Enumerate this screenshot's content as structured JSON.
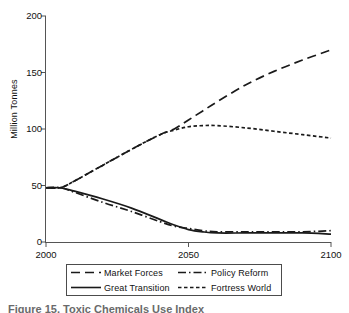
{
  "figure": {
    "caption": "Figure 15.  Toxic Chemicals Use Index",
    "ylabel": "Million Tonnes"
  },
  "chart_data": {
    "type": "line",
    "title": "",
    "xlabel": "",
    "ylabel": "Million Tonnes",
    "xlim": [
      2000,
      2100
    ],
    "ylim": [
      0,
      200
    ],
    "xticks": [
      2000,
      2050,
      2100
    ],
    "yticks": [
      0,
      50,
      100,
      150,
      200
    ],
    "grid": false,
    "legend_position": "below-plot",
    "x": [
      2000,
      2005,
      2010,
      2020,
      2030,
      2040,
      2045,
      2050,
      2055,
      2060,
      2070,
      2080,
      2090,
      2100
    ],
    "series": [
      {
        "name": "Market Forces",
        "style": "dashed",
        "color": "#1a1a1a",
        "values": [
          48,
          48,
          54,
          68,
          82,
          95,
          100,
          108,
          116,
          124,
          139,
          151,
          161,
          170
        ]
      },
      {
        "name": "Policy Reform",
        "style": "dash-dot",
        "color": "#1a1a1a",
        "values": [
          48,
          48,
          44,
          35,
          27,
          18,
          14,
          12,
          10,
          9,
          9,
          9,
          9,
          10
        ]
      },
      {
        "name": "Great Transition",
        "style": "solid",
        "color": "#1a1a1a",
        "values": [
          48,
          48,
          45,
          38,
          30,
          20,
          15,
          11,
          9,
          8,
          8,
          8,
          8,
          7
        ]
      },
      {
        "name": "Fortress World",
        "style": "short-dashed",
        "color": "#1a1a1a",
        "values": [
          48,
          48,
          54,
          68,
          82,
          95,
          99,
          102,
          103,
          103,
          101,
          98,
          95,
          92
        ]
      }
    ]
  },
  "legend": {
    "entries": [
      {
        "label": "Market Forces",
        "style": "dashed"
      },
      {
        "label": "Policy Reform",
        "style": "dash-dot"
      },
      {
        "label": "Great Transition",
        "style": "solid"
      },
      {
        "label": "Fortress World",
        "style": "short-dashed"
      }
    ]
  }
}
